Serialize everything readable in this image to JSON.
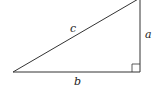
{
  "diagram": {
    "type": "right-triangle",
    "labels": {
      "hypotenuse": "c",
      "vertical_leg": "a",
      "horizontal_leg": "b"
    },
    "right_angle_marker": true,
    "colors": {
      "line": "#333333",
      "background": "#ffffff"
    }
  }
}
